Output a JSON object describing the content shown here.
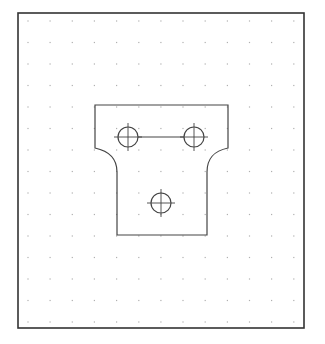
{
  "drawing": {
    "background": "#ffffff",
    "frame": {
      "x": 18,
      "y": 13,
      "width": 286,
      "height": 315,
      "stroke": "#333333",
      "stroke_width": 1.6
    },
    "grid": {
      "x0": 28,
      "y0": 21,
      "dx": 22.15,
      "dy": 21.5,
      "cols": 13,
      "rows": 15,
      "dot_color": "#b0b0b0"
    },
    "part": {
      "stroke": "#444444",
      "stroke_width": 1.2,
      "outline": {
        "top_left": [
          95,
          105
        ],
        "top_right": [
          228,
          105
        ],
        "shoulder_y": 148,
        "neck_left_x": 117,
        "neck_right_x": 207,
        "neck_y": 172,
        "bottom_y": 235
      },
      "holes": [
        {
          "name": "hole-top-left",
          "cx": 128,
          "cy": 137,
          "r": 10
        },
        {
          "name": "hole-top-right",
          "cx": 194,
          "cy": 137,
          "r": 10
        },
        {
          "name": "hole-bottom",
          "cx": 161,
          "cy": 203,
          "r": 10
        }
      ],
      "slot_line": {
        "x1": 138,
        "y1": 137,
        "x2": 184,
        "y2": 137
      }
    }
  }
}
